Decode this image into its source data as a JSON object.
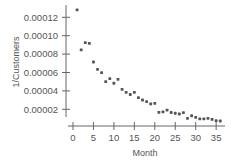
{
  "chart_data": {
    "type": "scatter",
    "title": "",
    "xlabel": "Month",
    "ylabel": "1/Customers",
    "xlim": [
      0,
      36
    ],
    "ylim": [
      0,
      0.00013
    ],
    "grid": false,
    "legend": null,
    "x_ticks": [
      0,
      5,
      10,
      15,
      20,
      25,
      30,
      35
    ],
    "x_tick_labels": [
      "0",
      "5",
      "10",
      "15",
      "20",
      "25",
      "30",
      "35"
    ],
    "y_ticks": [
      2e-05,
      4e-05,
      6e-05,
      8e-05,
      0.0001,
      0.00012
    ],
    "y_tick_labels": [
      "0.00002",
      "0.00004",
      "0.00006",
      "0.00008",
      "0.00010",
      "0.00012"
    ],
    "point_color": "#555555",
    "x": [
      1,
      2,
      3,
      4,
      5,
      6,
      7,
      8,
      9,
      10,
      11,
      12,
      13,
      14,
      15,
      16,
      17,
      18,
      19,
      20,
      21,
      22,
      23,
      24,
      25,
      26,
      27,
      28,
      29,
      30,
      31,
      32,
      33,
      34,
      35,
      36
    ],
    "y": [
      0.000128,
      8.45e-05,
      9.24e-05,
      9.17e-05,
      7.14e-05,
      6.35e-05,
      5.98e-05,
      5e-05,
      5.33e-05,
      4.83e-05,
      5.26e-05,
      4.17e-05,
      3.85e-05,
      3.61e-05,
      3.85e-05,
      3.26e-05,
      3.01e-05,
      2.83e-05,
      2.58e-05,
      2.65e-05,
      1.67e-05,
      1.71e-05,
      1.92e-05,
      1.65e-05,
      1.57e-05,
      1.49e-05,
      1.63e-05,
      1.02e-05,
      1.3e-05,
      1.13e-05,
      9.5e-06,
      9.5e-06,
      1.02e-05,
      9.1e-06,
      7.6e-06,
      7.3e-06
    ]
  }
}
